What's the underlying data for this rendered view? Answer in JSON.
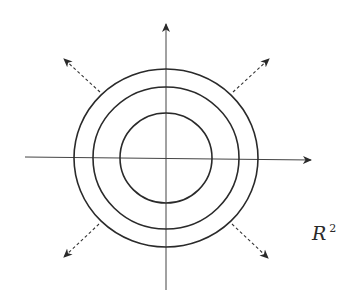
{
  "diagram": {
    "type": "concentric-circles-expanding",
    "space_label": {
      "base": "R",
      "superscript": "2"
    },
    "colors": {
      "stroke": "#2a2a2a",
      "axis": "#444444",
      "background": "#ffffff"
    },
    "center": [
      166,
      158
    ],
    "circles": [
      {
        "name": "inner",
        "rx": 46,
        "ry": 45
      },
      {
        "name": "middle",
        "rx": 73,
        "ry": 71
      },
      {
        "name": "outer",
        "rx": 92,
        "ry": 89
      }
    ],
    "axes": {
      "horizontal": {
        "from": [
          25,
          157
        ],
        "to": [
          313,
          160
        ]
      },
      "vertical": {
        "from": [
          166,
          290
        ],
        "to": [
          166,
          22
        ]
      }
    },
    "expansion_arrows": [
      {
        "direction": "up-left",
        "from": [
          100,
          92
        ],
        "to": [
          63,
          58
        ]
      },
      {
        "direction": "up-right",
        "from": [
          233,
          92
        ],
        "to": [
          270,
          58
        ]
      },
      {
        "direction": "down-left",
        "from": [
          99,
          224
        ],
        "to": [
          63,
          258
        ]
      },
      {
        "direction": "down-right",
        "from": [
          232,
          224
        ],
        "to": [
          269,
          259
        ]
      }
    ]
  }
}
